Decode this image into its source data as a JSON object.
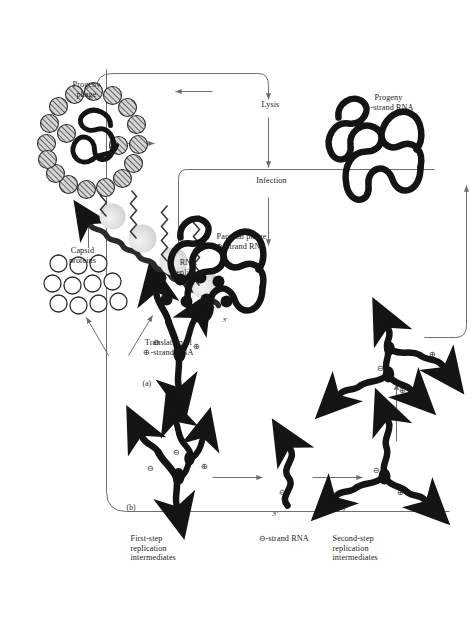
{
  "figure": {
    "orientation": "rotated-90-ccw",
    "background": "#ffffff",
    "ink": "#1b1b1b",
    "thin_line": "#6e6e6e"
  },
  "labels": {
    "second_step": "Second-step\nreplication\nintermediates",
    "first_step": "First-step\nreplication\nintermediates",
    "minus_strand_rna": "⊖-strand RNA",
    "progeny_plus_rna": "Progeny\n⊕-strand RNA",
    "translation": "Translation of\n⊕-strand RNA",
    "capsid_proteins": "Capsid\nproteins",
    "rna_replicase": "RNA\nreplicase",
    "progeny_phage": "Progeny\nphage",
    "parental_phage": "Parental phage\n⊕-strand RNA",
    "infection": "Infection",
    "lysis": "Lysis"
  },
  "panels": [
    {
      "id": "a",
      "tag": "(a)",
      "caption": "first-step replication intermediate",
      "strand_marks": [
        "⊖",
        "⊕"
      ],
      "ends": [
        "5'",
        "3'"
      ]
    },
    {
      "id": "b",
      "tag": "(b)",
      "caption": "first-step replication intermediate with nascent strands",
      "strand_marks": [
        "⊖",
        "⊖",
        "⊕"
      ],
      "ends": [
        "5'",
        "3'"
      ]
    },
    {
      "id": "c",
      "tag": "(c)",
      "caption": "second-step replication intermediate",
      "strand_marks": [
        "⊖",
        "⊕"
      ],
      "ends": [
        "5'",
        "3'"
      ]
    },
    {
      "id": "d",
      "tag": "(d)",
      "caption": "second-step replication intermediate with nascent strands",
      "strand_marks": [
        "⊖",
        "⊕",
        "⊕"
      ],
      "ends": [
        "5'",
        "3'"
      ]
    }
  ],
  "strand_symbols": {
    "plus": "⊕",
    "minus": "⊖"
  },
  "end_marks": {
    "five_prime": "5'",
    "three_prime": "3'"
  },
  "minus_strand_panel": {
    "mark": "⊖",
    "end": "3'"
  },
  "translation_panel": {
    "five_prime": "5'",
    "three_prime": "3'",
    "ribosome_count": 4
  },
  "counts": {
    "capsid_protein_circles": 11,
    "replicase_dots": 8,
    "capsomeres": 18
  }
}
